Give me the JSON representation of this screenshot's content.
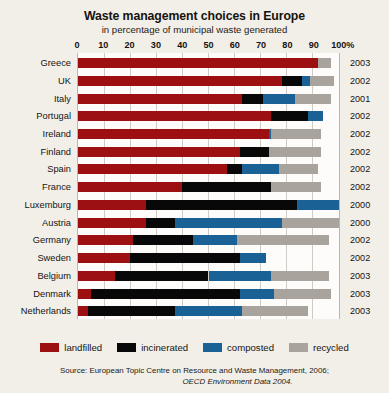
{
  "chart_data": {
    "type": "bar",
    "orientation": "horizontal",
    "stacked": true,
    "title": "Waste management choices in Europe",
    "subtitle": "in percentage of municipal waste generated",
    "xlabel": "",
    "ylabel": "",
    "xlim": [
      0,
      100
    ],
    "xticks": [
      0,
      10,
      20,
      30,
      40,
      50,
      60,
      70,
      80,
      90,
      100
    ],
    "xtick_labels": [
      "0",
      "10",
      "20",
      "30",
      "40",
      "50",
      "60",
      "70",
      "80",
      "90",
      "100%"
    ],
    "grid": true,
    "legend_position": "bottom",
    "categories": [
      "Greece",
      "UK",
      "Italy",
      "Portugal",
      "Ireland",
      "Finland",
      "Spain",
      "France",
      "Luxemburg",
      "Austria",
      "Germany",
      "Sweden",
      "Belgium",
      "Denmark",
      "Netherlands"
    ],
    "annotations": [
      "2003",
      "2002",
      "2001",
      "2002",
      "2002",
      "2002",
      "2002",
      "2002",
      "2000",
      "2000",
      "2002",
      "2002",
      "2003",
      "2003",
      "2003"
    ],
    "series": [
      {
        "name": "landfilled",
        "color": "#9c1012",
        "values": [
          92,
          78,
          63,
          74,
          73,
          62,
          57,
          40,
          26,
          26,
          21,
          20,
          14,
          5,
          4
        ]
      },
      {
        "name": "incinerated",
        "color": "#080808",
        "values": [
          0,
          8,
          8,
          14,
          0,
          11,
          6,
          34,
          58,
          11,
          23,
          42,
          36,
          57,
          33
        ]
      },
      {
        "name": "composted",
        "color": "#1a6196",
        "values": [
          0,
          3,
          12,
          6,
          1,
          0,
          14,
          0,
          16,
          41,
          17,
          10,
          24,
          13,
          26
        ]
      },
      {
        "name": "recycled",
        "color": "#a8a49d",
        "values": [
          5,
          9,
          14,
          0,
          19,
          20,
          15,
          19,
          0,
          22,
          35,
          0,
          22,
          22,
          25
        ]
      }
    ],
    "rows": [
      {
        "country": "Greece",
        "year": "2003",
        "landfilled": 92,
        "incinerated": 0,
        "composted": 0,
        "recycled": 5
      },
      {
        "country": "UK",
        "year": "2002",
        "landfilled": 78,
        "incinerated": 8,
        "composted": 3,
        "recycled": 9
      },
      {
        "country": "Italy",
        "year": "2001",
        "landfilled": 63,
        "incinerated": 8,
        "composted": 12,
        "recycled": 14
      },
      {
        "country": "Portugal",
        "year": "2002",
        "landfilled": 74,
        "incinerated": 14,
        "composted": 6,
        "recycled": 0
      },
      {
        "country": "Ireland",
        "year": "2002",
        "landfilled": 73,
        "incinerated": 0,
        "composted": 1,
        "recycled": 19
      },
      {
        "country": "Finland",
        "year": "2002",
        "landfilled": 62,
        "incinerated": 11,
        "composted": 0,
        "recycled": 20
      },
      {
        "country": "Spain",
        "year": "2002",
        "landfilled": 57,
        "incinerated": 6,
        "composted": 14,
        "recycled": 15
      },
      {
        "country": "France",
        "year": "2002",
        "landfilled": 40,
        "incinerated": 34,
        "composted": 0,
        "recycled": 19
      },
      {
        "country": "Luxemburg",
        "year": "2000",
        "landfilled": 26,
        "incinerated": 58,
        "composted": 16,
        "recycled": 0
      },
      {
        "country": "Austria",
        "year": "2000",
        "landfilled": 26,
        "incinerated": 11,
        "composted": 41,
        "recycled": 22
      },
      {
        "country": "Germany",
        "year": "2002",
        "landfilled": 21,
        "incinerated": 23,
        "composted": 17,
        "recycled": 35
      },
      {
        "country": "Sweden",
        "year": "2002",
        "landfilled": 20,
        "incinerated": 42,
        "composted": 10,
        "recycled": 0
      },
      {
        "country": "Belgium",
        "year": "2003",
        "landfilled": 14,
        "incinerated": 36,
        "composted": 24,
        "recycled": 22
      },
      {
        "country": "Denmark",
        "year": "2003",
        "landfilled": 5,
        "incinerated": 57,
        "composted": 13,
        "recycled": 22
      },
      {
        "country": "Netherlands",
        "year": "2003",
        "landfilled": 4,
        "incinerated": 33,
        "composted": 26,
        "recycled": 25
      }
    ]
  },
  "legend": {
    "items": [
      {
        "label": "landfilled",
        "color": "#9c1012"
      },
      {
        "label": "incinerated",
        "color": "#080808"
      },
      {
        "label": "composted",
        "color": "#1a6196"
      },
      {
        "label": "recycled",
        "color": "#a8a49d"
      }
    ]
  },
  "source": {
    "line1": "Source: European Topic Centre on Resource and Waste Management, 2006;",
    "line2": "OECD Environment Data 2004."
  }
}
